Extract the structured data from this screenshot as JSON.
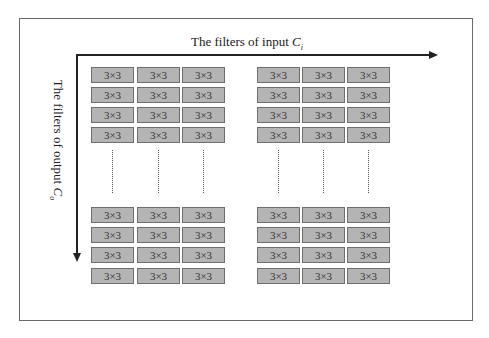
{
  "diagram": {
    "horizontal_axis": {
      "label": "The filters of input ",
      "symbol": "C",
      "subscript": "i"
    },
    "vertical_axis": {
      "label": "The filters of output ",
      "symbol": "C",
      "subscript": "o"
    },
    "cell_label": "3×3",
    "groups": [
      {
        "name": "top-left",
        "rows": 4,
        "cols": 3
      },
      {
        "name": "top-right",
        "rows": 4,
        "cols": 3
      },
      {
        "name": "bottom-left",
        "rows": 4,
        "cols": 3
      },
      {
        "name": "bottom-right",
        "rows": 4,
        "cols": 3
      }
    ],
    "ellipsis": "vertical dotted continuation between top and bottom blocks",
    "colors": {
      "cell_fill": "#b4b4b4",
      "cell_border": "#6e6e6e",
      "arrow": "#222222",
      "frame": "#6a6a6a"
    }
  }
}
